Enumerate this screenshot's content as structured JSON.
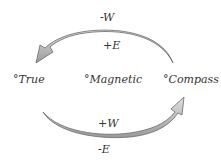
{
  "diagram": {
    "nodes": [
      {
        "id": "true",
        "label": "°True"
      },
      {
        "id": "magnetic",
        "label": "°Magnetic"
      },
      {
        "id": "compass",
        "label": "°Compass"
      }
    ],
    "arrows": [
      {
        "from": "compass",
        "to": "true",
        "label_above": "-W",
        "label_below": "+E"
      },
      {
        "from": "true",
        "to": "compass",
        "label_above": "+W",
        "label_below": "-E"
      }
    ],
    "colors": {
      "arrow_fill": "#b8b8b8",
      "arrow_stroke": "#6a6a6a",
      "text": "#333333"
    }
  }
}
